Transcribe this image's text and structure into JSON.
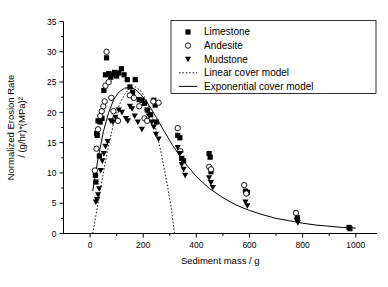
{
  "chart_data": {
    "type": "scatter",
    "title": "",
    "xlabel": "Sediment mass / g",
    "ylabel_line1": "Normalized Erosion Rate",
    "ylabel_line2": "/ (g/hr)*(MPa)²",
    "xlim": [
      -100,
      1080
    ],
    "ylim": [
      0,
      35
    ],
    "xticks": [
      0,
      200,
      400,
      600,
      800,
      1000
    ],
    "xtick_labels": [
      "0",
      "200",
      "400",
      "600",
      "800",
      "1000"
    ],
    "yticks": [
      0,
      5,
      10,
      15,
      20,
      25,
      30,
      35
    ],
    "ytick_labels": [
      "0",
      "5",
      "10",
      "15",
      "20",
      "25",
      "30",
      "35"
    ],
    "minor_ticks": true,
    "grid": false,
    "legend_position": "top-right",
    "series": [
      {
        "name": "Limestone",
        "marker": "filled-square",
        "color": "#000000",
        "points": [
          [
            20,
            9.6
          ],
          [
            22,
            8.5
          ],
          [
            25,
            16.5
          ],
          [
            27,
            16.2
          ],
          [
            30,
            18.6
          ],
          [
            35,
            12.8
          ],
          [
            38,
            18.4
          ],
          [
            45,
            19.0
          ],
          [
            52,
            23.6
          ],
          [
            58,
            26.2
          ],
          [
            62,
            29.0
          ],
          [
            70,
            26.4
          ],
          [
            78,
            25.8
          ],
          [
            85,
            26.3
          ],
          [
            92,
            26.6
          ],
          [
            100,
            26.0
          ],
          [
            108,
            26.5
          ],
          [
            118,
            27.2
          ],
          [
            128,
            26.2
          ],
          [
            140,
            25.4
          ],
          [
            150,
            24.2
          ],
          [
            160,
            23.3
          ],
          [
            170,
            25.4
          ],
          [
            185,
            22.1
          ],
          [
            195,
            22.0
          ],
          [
            205,
            21.5
          ],
          [
            215,
            20.4
          ],
          [
            228,
            19.6
          ],
          [
            240,
            22.0
          ],
          [
            245,
            21.2
          ],
          [
            250,
            18.4
          ],
          [
            330,
            16.2
          ],
          [
            338,
            15.8
          ],
          [
            345,
            12.4
          ],
          [
            352,
            12.0
          ],
          [
            448,
            13.2
          ],
          [
            452,
            12.6
          ],
          [
            455,
            10.2
          ],
          [
            585,
            7.0
          ],
          [
            592,
            6.8
          ],
          [
            780,
            2.6
          ],
          [
            975,
            1.0
          ],
          [
            978,
            0.8
          ]
        ]
      },
      {
        "name": "Andesite",
        "marker": "open-circle",
        "color": "#000000",
        "points": [
          [
            18,
            10.4
          ],
          [
            24,
            14.0
          ],
          [
            30,
            17.2
          ],
          [
            38,
            19.4
          ],
          [
            44,
            20.2
          ],
          [
            50,
            21.0
          ],
          [
            55,
            21.8
          ],
          [
            58,
            24.4
          ],
          [
            62,
            30.0
          ],
          [
            70,
            25.0
          ],
          [
            80,
            22.4
          ],
          [
            88,
            20.2
          ],
          [
            95,
            19.0
          ],
          [
            105,
            18.6
          ],
          [
            150,
            22.8
          ],
          [
            165,
            22.4
          ],
          [
            185,
            21.0
          ],
          [
            205,
            19.0
          ],
          [
            215,
            18.6
          ],
          [
            238,
            21.8
          ],
          [
            258,
            21.6
          ],
          [
            330,
            17.4
          ],
          [
            340,
            13.6
          ],
          [
            448,
            11.0
          ],
          [
            455,
            10.6
          ],
          [
            580,
            8.0
          ],
          [
            588,
            6.6
          ],
          [
            775,
            3.4
          ]
        ]
      },
      {
        "name": "Mudstone",
        "marker": "filled-triangle-down",
        "color": "#000000",
        "points": [
          [
            22,
            5.2
          ],
          [
            26,
            5.6
          ],
          [
            30,
            6.4
          ],
          [
            34,
            7.4
          ],
          [
            40,
            10.4
          ],
          [
            46,
            12.0
          ],
          [
            52,
            13.2
          ],
          [
            58,
            14.4
          ],
          [
            66,
            15.2
          ],
          [
            78,
            18.6
          ],
          [
            86,
            18.4
          ],
          [
            95,
            19.2
          ],
          [
            108,
            20.4
          ],
          [
            120,
            20.0
          ],
          [
            135,
            19.0
          ],
          [
            142,
            18.6
          ],
          [
            150,
            21.0
          ],
          [
            158,
            20.6
          ],
          [
            168,
            19.4
          ],
          [
            180,
            18.4
          ],
          [
            195,
            17.2
          ],
          [
            215,
            20.2
          ],
          [
            222,
            19.4
          ],
          [
            232,
            18.4
          ],
          [
            240,
            17.6
          ],
          [
            248,
            16.4
          ],
          [
            258,
            15.6
          ],
          [
            330,
            14.2
          ],
          [
            338,
            13.2
          ],
          [
            345,
            11.4
          ],
          [
            352,
            10.6
          ],
          [
            358,
            9.6
          ],
          [
            448,
            9.2
          ],
          [
            455,
            8.4
          ],
          [
            462,
            7.6
          ],
          [
            585,
            5.2
          ],
          [
            592,
            4.6
          ],
          [
            778,
            2.2
          ],
          [
            782,
            1.8
          ]
        ]
      }
    ],
    "models": [
      {
        "name": "Linear cover model",
        "style": "dotted",
        "color": "#000000",
        "points": [
          [
            10,
            0
          ],
          [
            30,
            5.0
          ],
          [
            50,
            10.0
          ],
          [
            70,
            14.6
          ],
          [
            90,
            18.4
          ],
          [
            110,
            21.2
          ],
          [
            130,
            23.0
          ],
          [
            150,
            24.0
          ],
          [
            170,
            24.2
          ],
          [
            190,
            23.6
          ],
          [
            210,
            22.2
          ],
          [
            230,
            20.0
          ],
          [
            250,
            16.8
          ],
          [
            270,
            12.8
          ],
          [
            290,
            8.2
          ],
          [
            305,
            4.4
          ],
          [
            318,
            0
          ]
        ]
      },
      {
        "name": "Exponential cover model",
        "style": "solid",
        "color": "#000000",
        "points": [
          [
            10,
            7.0
          ],
          [
            30,
            12.4
          ],
          [
            50,
            16.8
          ],
          [
            70,
            20.0
          ],
          [
            90,
            22.2
          ],
          [
            110,
            23.4
          ],
          [
            130,
            24.0
          ],
          [
            150,
            24.1
          ],
          [
            170,
            23.8
          ],
          [
            190,
            23.0
          ],
          [
            210,
            21.9
          ],
          [
            230,
            20.6
          ],
          [
            250,
            19.1
          ],
          [
            280,
            16.8
          ],
          [
            310,
            14.6
          ],
          [
            350,
            12.0
          ],
          [
            400,
            9.4
          ],
          [
            450,
            7.4
          ],
          [
            500,
            5.9
          ],
          [
            550,
            4.7
          ],
          [
            600,
            3.8
          ],
          [
            650,
            3.1
          ],
          [
            700,
            2.5
          ],
          [
            750,
            2.1
          ],
          [
            800,
            1.7
          ],
          [
            850,
            1.4
          ],
          [
            900,
            1.2
          ],
          [
            950,
            1.0
          ],
          [
            1000,
            0.9
          ]
        ]
      }
    ],
    "legend_items": [
      {
        "label": "Limestone",
        "marker": "filled-square"
      },
      {
        "label": "Andesite",
        "marker": "open-circle"
      },
      {
        "label": "Mudstone",
        "marker": "filled-triangle-down"
      },
      {
        "label": "Linear cover model",
        "marker": "dotted-line"
      },
      {
        "label": "Exponential cover model",
        "marker": "solid-line"
      }
    ]
  }
}
